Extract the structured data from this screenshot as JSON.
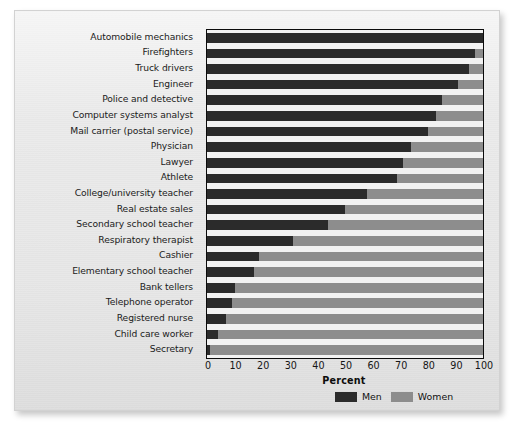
{
  "chart_data": {
    "type": "bar",
    "subtype": "horizontal-stacked-100",
    "title": "",
    "xlabel": "Percent",
    "ylabel": "",
    "xlim": [
      0,
      100
    ],
    "xticks": [
      0,
      10,
      20,
      30,
      40,
      50,
      60,
      70,
      80,
      90,
      100
    ],
    "grid": false,
    "legend_position": "bottom-right",
    "categories": [
      "Automobile mechanics",
      "Firefighters",
      "Truck drivers",
      "Engineer",
      "Police and detective",
      "Computer systems analyst",
      "Mail carrier (postal service)",
      "Physician",
      "Lawyer",
      "Athlete",
      "College/university teacher",
      "Real estate sales",
      "Secondary school teacher",
      "Respiratory therapist",
      "Cashier",
      "Elementary school teacher",
      "Bank tellers",
      "Telephone operator",
      "Registered nurse",
      "Child care worker",
      "Secretary"
    ],
    "series": [
      {
        "name": "Men",
        "color": "#2b2b2b",
        "values": [
          100,
          97,
          95,
          91,
          85,
          83,
          80,
          74,
          71,
          69,
          58,
          50,
          44,
          31,
          19,
          17,
          10,
          9,
          7,
          4,
          1
        ]
      },
      {
        "name": "Women",
        "color": "#8d8d8d",
        "values": [
          0,
          3,
          5,
          9,
          15,
          17,
          20,
          26,
          29,
          31,
          42,
          50,
          56,
          69,
          81,
          83,
          90,
          91,
          93,
          96,
          99
        ]
      }
    ]
  },
  "legend": {
    "items": [
      {
        "label": "Men",
        "color": "#2b2b2b",
        "swatch": "legend-swatch-men"
      },
      {
        "label": "Women",
        "color": "#8d8d8d",
        "swatch": "legend-swatch-women"
      }
    ]
  }
}
